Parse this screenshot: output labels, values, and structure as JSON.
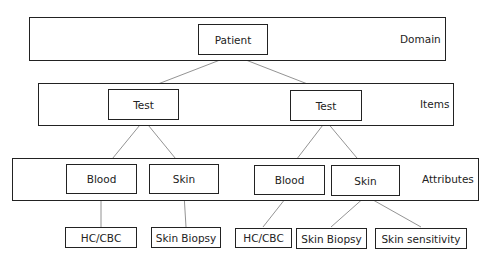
{
  "levels": {
    "domain": {
      "label": "Domain"
    },
    "items": {
      "label": "Items"
    },
    "attributes": {
      "label": "Attributes"
    }
  },
  "nodes": {
    "root": {
      "label": "Patient"
    },
    "test1": {
      "label": "Test"
    },
    "test2": {
      "label": "Test"
    },
    "blood1": {
      "label": "Blood"
    },
    "skin1": {
      "label": "Skin"
    },
    "blood2": {
      "label": "Blood"
    },
    "skin2": {
      "label": "Skin"
    },
    "leaf1": {
      "label": "HC/CBC"
    },
    "leaf2": {
      "label": "Skin Biopsy"
    },
    "leaf3": {
      "label": "HC/CBC"
    },
    "leaf4": {
      "label": "Skin Biopsy"
    },
    "leaf5": {
      "label": "Skin sensitivity"
    }
  },
  "colors": {
    "stroke": "#222222",
    "link": "#777777",
    "background": "#ffffff"
  }
}
